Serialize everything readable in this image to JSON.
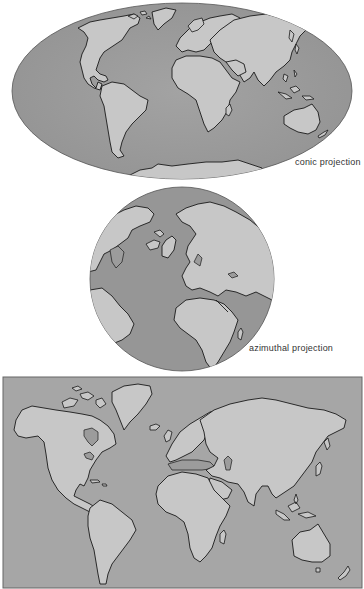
{
  "figure": {
    "colors": {
      "ocean": "#9a9a9a",
      "ocean_rect": "#a6a6a6",
      "land": "#c7c7c7",
      "coastline": "#1a1a1a",
      "background": "#ffffff"
    },
    "maps": [
      {
        "id": "conic",
        "shape": "ellipse",
        "label": "conic projection"
      },
      {
        "id": "azimuthal",
        "shape": "circle",
        "label": "azimuthal projection"
      },
      {
        "id": "cylindrical",
        "shape": "rectangle",
        "label": ""
      }
    ]
  }
}
